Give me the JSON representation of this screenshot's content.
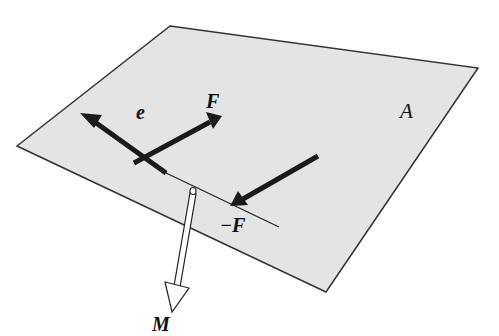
{
  "diagram": {
    "type": "force-couple-on-plane",
    "colors": {
      "plane_fill": "#e4e4e4",
      "plane_edge": "#333333",
      "arrow": "#1a1a1a",
      "moment_arrow_fill": "#ffffff",
      "background": "#ffffff"
    },
    "plane": {
      "label": "A",
      "vertices": [
        [
          170,
          26
        ],
        [
          478,
          68
        ],
        [
          326,
          292
        ],
        [
          17,
          146
        ]
      ]
    },
    "lever_line": {
      "from": [
        164,
        172
      ],
      "to": [
        279,
        227
      ]
    },
    "vectors": [
      {
        "id": "e",
        "label": "e",
        "from": [
          164,
          172
        ],
        "to": [
          80,
          113
        ]
      },
      {
        "id": "F",
        "label": "F",
        "from": [
          134,
          163
        ],
        "to": [
          222,
          116
        ]
      },
      {
        "id": "minus_F",
        "label": "−F",
        "from": [
          318,
          156
        ],
        "to": [
          230,
          206
        ]
      },
      {
        "id": "M",
        "label": "M",
        "from": [
          194,
          191
        ],
        "to": [
          168,
          310
        ]
      }
    ],
    "labels": {
      "e": "e",
      "F": "F",
      "minus_F": "−F",
      "A": "A",
      "M": "M"
    }
  }
}
